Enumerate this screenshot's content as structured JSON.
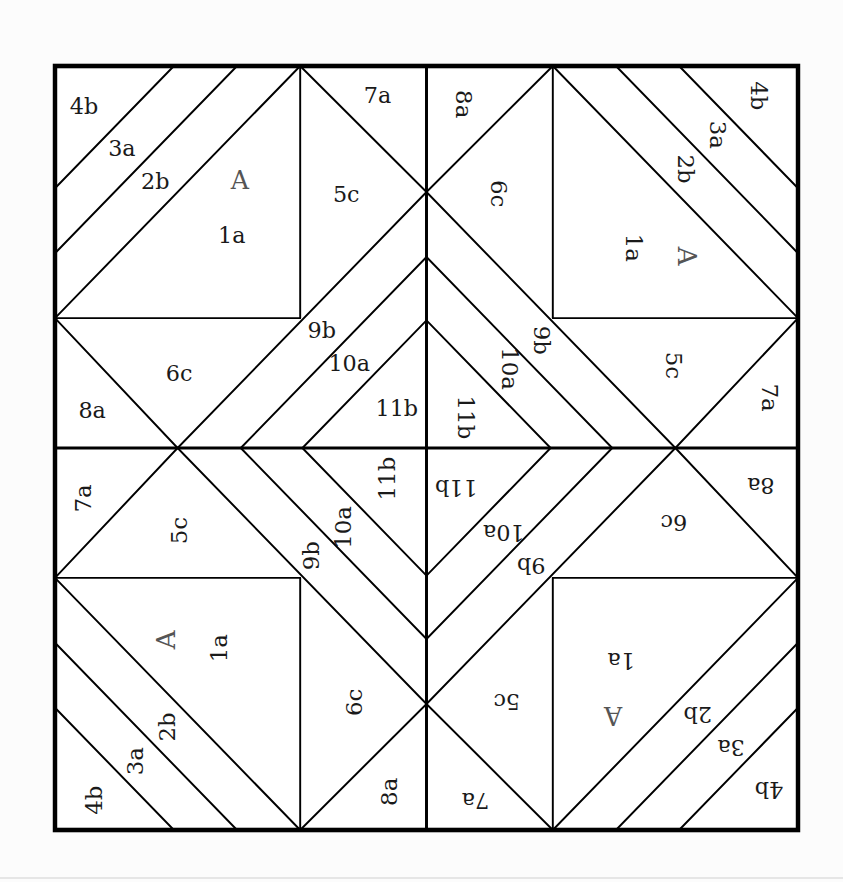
{
  "diagram": {
    "type": "quilt-block",
    "layout": "four identical quadrants rotated 0, 90, 180 and 270 degrees about the block center",
    "colors": {
      "line": "#000000",
      "fill": "#ffffff",
      "label": "#1a1a1a",
      "section_label": "#555555",
      "background": "#fcfcfc"
    },
    "quadrants": [
      {
        "id": "top-left",
        "rotation": 0
      },
      {
        "id": "top-right",
        "rotation": 90
      },
      {
        "id": "bottom-right",
        "rotation": 180
      },
      {
        "id": "bottom-left",
        "rotation": 270
      }
    ],
    "section_label": "A",
    "pieces": [
      {
        "label": "1a",
        "section": "A",
        "x": 238,
        "y": 224
      },
      {
        "label": "2b",
        "section": "A",
        "x": 135,
        "y": 153
      },
      {
        "label": "3a",
        "section": "A",
        "x": 90,
        "y": 110
      },
      {
        "label": "4b",
        "section": "A",
        "x": 39,
        "y": 55
      },
      {
        "label": "5c",
        "x": 392,
        "y": 170
      },
      {
        "label": "6c",
        "x": 167,
        "y": 405
      },
      {
        "label": "7a",
        "x": 434,
        "y": 41
      },
      {
        "label": "8a",
        "x": 50,
        "y": 453
      },
      {
        "label": "9b",
        "x": 359,
        "y": 348
      },
      {
        "label": "10a",
        "x": 396,
        "y": 391
      },
      {
        "label": "11b",
        "x": 460,
        "y": 450
      }
    ],
    "section_label_pos": {
      "x": 249,
      "y": 152
    }
  }
}
